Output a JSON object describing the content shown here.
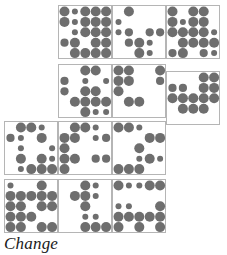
{
  "figure": {
    "name": "dot-matrix-panel-grid",
    "caption": "Change",
    "canvas": {
      "width": 227,
      "height": 255
    },
    "style": {
      "background": "#ffffff",
      "dot_color": "#6e6e6e",
      "cell_border_color": "#b5b5b5",
      "cell_fill": "#ffffff",
      "cell_border_width": 1
    },
    "layout": {
      "cell_size": 54,
      "dot_grid": {
        "cols": 5,
        "rows": 5
      },
      "dot_pitch": 10.4,
      "dot_margin": 6.5,
      "radius_scale": {
        "0": 0,
        "1": 1.9,
        "2": 3.0,
        "3": 4.1,
        "4": 5.0
      },
      "description": "Twelve square panels arranged in a descending staircase: top band of three panels offset right, middle band of three panels stepped, lower band of three panels offset left, bottom band of three panels."
    },
    "panels": [
      {
        "id": "panel-r1c1",
        "x": 58,
        "y": 5,
        "dots": [
          [
            4,
            2,
            4,
            4,
            4
          ],
          [
            4,
            2,
            4,
            4,
            4
          ],
          [
            0,
            2,
            4,
            4,
            4
          ],
          [
            3,
            4,
            0,
            4,
            4
          ],
          [
            0,
            4,
            4,
            4,
            4
          ]
        ]
      },
      {
        "id": "panel-r1c2",
        "x": 112,
        "y": 5,
        "dots": [
          [
            0,
            4,
            0,
            0,
            0
          ],
          [
            2,
            0,
            0,
            0,
            0
          ],
          [
            2,
            3,
            0,
            3,
            3
          ],
          [
            0,
            3,
            4,
            2,
            0
          ],
          [
            0,
            0,
            4,
            2,
            0
          ]
        ]
      },
      {
        "id": "panel-r1c3",
        "x": 166,
        "y": 5,
        "dots": [
          [
            4,
            0,
            4,
            4,
            0
          ],
          [
            4,
            2,
            4,
            4,
            0
          ],
          [
            4,
            4,
            4,
            4,
            2
          ],
          [
            0,
            4,
            4,
            4,
            4
          ],
          [
            3,
            4,
            0,
            3,
            2
          ]
        ]
      },
      {
        "id": "panel-r2c1",
        "x": 58,
        "y": 64,
        "dots": [
          [
            0,
            0,
            4,
            4,
            0
          ],
          [
            3,
            0,
            2,
            0,
            2
          ],
          [
            3,
            0,
            4,
            4,
            0
          ],
          [
            0,
            4,
            4,
            4,
            4
          ],
          [
            0,
            0,
            4,
            2,
            2
          ]
        ]
      },
      {
        "id": "panel-r2c2",
        "x": 112,
        "y": 64,
        "dots": [
          [
            4,
            4,
            0,
            0,
            4
          ],
          [
            4,
            4,
            0,
            0,
            3
          ],
          [
            4,
            0,
            0,
            0,
            0
          ],
          [
            0,
            4,
            4,
            0,
            0
          ],
          [
            0,
            0,
            0,
            0,
            0
          ]
        ]
      },
      {
        "id": "panel-r2c3",
        "x": 166,
        "y": 71,
        "dots": [
          [
            0,
            0,
            0,
            4,
            4
          ],
          [
            3,
            3,
            0,
            4,
            4
          ],
          [
            4,
            4,
            4,
            4,
            4
          ],
          [
            0,
            4,
            4,
            4,
            0
          ],
          [
            0,
            0,
            0,
            0,
            0
          ]
        ]
      },
      {
        "id": "panel-r3c1",
        "x": 4,
        "y": 121,
        "dots": [
          [
            0,
            4,
            4,
            2,
            0
          ],
          [
            3,
            2,
            0,
            4,
            0
          ],
          [
            0,
            2,
            0,
            0,
            2
          ],
          [
            0,
            4,
            0,
            4,
            2
          ],
          [
            0,
            2,
            4,
            4,
            4
          ]
        ]
      },
      {
        "id": "panel-r3c2",
        "x": 58,
        "y": 121,
        "dots": [
          [
            0,
            4,
            4,
            2,
            0
          ],
          [
            4,
            4,
            0,
            2,
            3
          ],
          [
            4,
            0,
            0,
            0,
            0
          ],
          [
            4,
            4,
            0,
            3,
            3
          ],
          [
            4,
            0,
            0,
            0,
            0
          ]
        ]
      },
      {
        "id": "panel-r3c3",
        "x": 112,
        "y": 121,
        "dots": [
          [
            4,
            4,
            2,
            0,
            0
          ],
          [
            0,
            0,
            0,
            4,
            4
          ],
          [
            0,
            0,
            4,
            0,
            0
          ],
          [
            0,
            0,
            2,
            4,
            2
          ],
          [
            4,
            4,
            4,
            0,
            0
          ]
        ]
      },
      {
        "id": "panel-r4c1",
        "x": 4,
        "y": 179,
        "dots": [
          [
            2,
            0,
            0,
            4,
            0
          ],
          [
            4,
            4,
            4,
            4,
            4
          ],
          [
            4,
            4,
            0,
            4,
            4
          ],
          [
            4,
            4,
            4,
            0,
            0
          ],
          [
            4,
            4,
            0,
            4,
            4
          ]
        ]
      },
      {
        "id": "panel-r4c2",
        "x": 58,
        "y": 179,
        "dots": [
          [
            0,
            0,
            4,
            2,
            0
          ],
          [
            0,
            4,
            4,
            2,
            0
          ],
          [
            0,
            0,
            4,
            0,
            0
          ],
          [
            0,
            0,
            2,
            2,
            0
          ],
          [
            0,
            0,
            4,
            4,
            4
          ]
        ]
      },
      {
        "id": "panel-r4c3",
        "x": 112,
        "y": 179,
        "dots": [
          [
            4,
            2,
            2,
            4,
            4
          ],
          [
            0,
            0,
            0,
            0,
            0
          ],
          [
            2,
            2,
            0,
            0,
            4
          ],
          [
            4,
            4,
            4,
            4,
            4
          ],
          [
            4,
            0,
            4,
            0,
            4
          ]
        ]
      }
    ]
  }
}
